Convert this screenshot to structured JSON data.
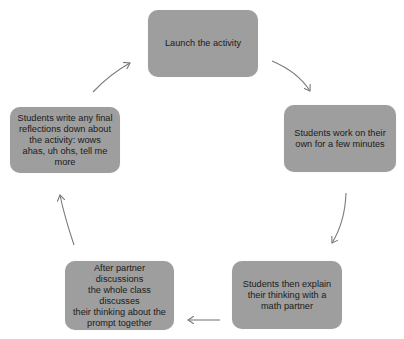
{
  "diagram": {
    "type": "cycle",
    "node_color": "#9e9e9e",
    "arrow_color": "#7a7a7a",
    "nodes": [
      {
        "id": "launch",
        "label": "Launch the activity"
      },
      {
        "id": "work-alone",
        "label": "Students work on their\nown for a few minutes"
      },
      {
        "id": "explain-partner",
        "label": "Students then explain\ntheir thinking with  a\nmath partner"
      },
      {
        "id": "class-discussion",
        "label": "After partner discussions\nthe whole class discusses\ntheir thinking about the\nprompt together"
      },
      {
        "id": "reflections",
        "label": "Students write any final\nreflections down  about\nthe activity:  wows\nahas, uh ohs, tell me\nmore"
      }
    ],
    "edges": [
      {
        "from": "launch",
        "to": "work-alone"
      },
      {
        "from": "work-alone",
        "to": "explain-partner"
      },
      {
        "from": "explain-partner",
        "to": "class-discussion"
      },
      {
        "from": "class-discussion",
        "to": "reflections"
      },
      {
        "from": "reflections",
        "to": "launch"
      }
    ]
  }
}
